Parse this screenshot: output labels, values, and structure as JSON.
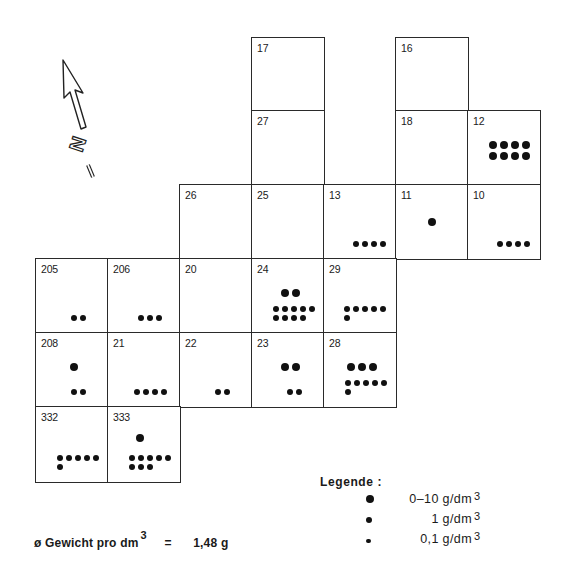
{
  "map": {
    "north_label": "N",
    "cells": [
      {
        "id": "17",
        "col": 3,
        "row": 0,
        "dots": []
      },
      {
        "id": "16",
        "col": 5,
        "row": 0,
        "dots": []
      },
      {
        "id": "27",
        "col": 3,
        "row": 1,
        "dots": []
      },
      {
        "id": "18",
        "col": 5,
        "row": 1,
        "dots": []
      },
      {
        "id": "12",
        "col": 6,
        "row": 1,
        "dots": [
          {
            "size": "large",
            "rows": [
              4,
              4
            ],
            "pos": "mid-right"
          }
        ]
      },
      {
        "id": "26",
        "col": 2,
        "row": 2,
        "dots": []
      },
      {
        "id": "25",
        "col": 3,
        "row": 2,
        "dots": []
      },
      {
        "id": "13",
        "col": 4,
        "row": 2,
        "dots": [
          {
            "size": "medium",
            "rows": [
              4
            ],
            "pos": "bottom-right"
          }
        ]
      },
      {
        "id": "11",
        "col": 5,
        "row": 2,
        "dots": [
          {
            "size": "large",
            "rows": [
              1
            ],
            "pos": "center"
          }
        ]
      },
      {
        "id": "10",
        "col": 6,
        "row": 2,
        "dots": [
          {
            "size": "medium",
            "rows": [
              4
            ],
            "pos": "bottom-right"
          }
        ]
      },
      {
        "id": "205",
        "col": 0,
        "row": 3,
        "dots": [
          {
            "size": "medium",
            "rows": [
              2
            ],
            "pos": "bottom-center"
          }
        ]
      },
      {
        "id": "206",
        "col": 1,
        "row": 3,
        "dots": [
          {
            "size": "medium",
            "rows": [
              3
            ],
            "pos": "bottom-center"
          }
        ]
      },
      {
        "id": "20",
        "col": 2,
        "row": 3,
        "dots": []
      },
      {
        "id": "24",
        "col": 3,
        "row": 3,
        "dots": [
          {
            "size": "large",
            "rows": [
              2
            ],
            "pos": "mid-center"
          },
          {
            "size": "medium",
            "rows": [
              5,
              4
            ],
            "pos": "bottom-center"
          }
        ]
      },
      {
        "id": "29",
        "col": 4,
        "row": 3,
        "dots": [
          {
            "size": "medium",
            "rows": [
              5,
              1
            ],
            "pos": "bottom-right"
          }
        ]
      },
      {
        "id": "208",
        "col": 0,
        "row": 4,
        "dots": [
          {
            "size": "large",
            "rows": [
              1
            ],
            "pos": "mid-center"
          },
          {
            "size": "medium",
            "rows": [
              2
            ],
            "pos": "bottom-center"
          }
        ]
      },
      {
        "id": "21",
        "col": 1,
        "row": 4,
        "dots": [
          {
            "size": "medium",
            "rows": [
              4
            ],
            "pos": "bottom-center"
          }
        ]
      },
      {
        "id": "22",
        "col": 2,
        "row": 4,
        "dots": [
          {
            "size": "medium",
            "rows": [
              2
            ],
            "pos": "bottom-center"
          }
        ]
      },
      {
        "id": "23",
        "col": 3,
        "row": 4,
        "dots": [
          {
            "size": "large",
            "rows": [
              2
            ],
            "pos": "mid-center"
          },
          {
            "size": "medium",
            "rows": [
              2
            ],
            "pos": "bottom-center"
          }
        ]
      },
      {
        "id": "28",
        "col": 4,
        "row": 4,
        "dots": [
          {
            "size": "large",
            "rows": [
              3
            ],
            "pos": "mid-center"
          },
          {
            "size": "medium",
            "rows": [
              5,
              1
            ],
            "pos": "bottom-center"
          }
        ]
      },
      {
        "id": "332",
        "col": 0,
        "row": 5,
        "dots": [
          {
            "size": "medium",
            "rows": [
              5,
              1
            ],
            "pos": "bottom-center"
          }
        ]
      },
      {
        "id": "333",
        "col": 1,
        "row": 5,
        "dots": [
          {
            "size": "large",
            "rows": [
              1
            ],
            "pos": "mid-left"
          },
          {
            "size": "medium",
            "rows": [
              5,
              3
            ],
            "pos": "bottom-center"
          }
        ]
      }
    ]
  },
  "legend": {
    "title": "Legende :",
    "items": [
      {
        "size": "large",
        "label": "0–10 g/dm",
        "exp": "3"
      },
      {
        "size": "medium",
        "label": "1 g/dm",
        "exp": "3"
      },
      {
        "size": "small",
        "label": "0,1 g/dm",
        "exp": "3"
      }
    ]
  },
  "footer": {
    "prefix": "ø Gewicht pro dm",
    "exp": "3",
    "equals": "=",
    "value": "1,48 g"
  }
}
